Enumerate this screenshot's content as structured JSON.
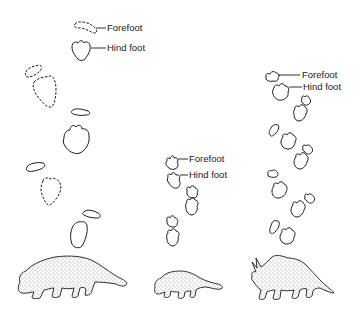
{
  "figure": {
    "ink_color": "#1a1a1a",
    "background": "#ffffff"
  },
  "trackways": [
    {
      "name": "large-ankylosaur-trackway",
      "labels": {
        "forefoot": "Forefoot",
        "hind_foot": "Hind foot"
      },
      "animal": "ankylosaur-large"
    },
    {
      "name": "small-ankylosaur-trackway",
      "labels": {
        "forefoot": "Forefoot",
        "hind_foot": "Hind foot"
      },
      "animal": "ankylosaur-small"
    },
    {
      "name": "ceratopsian-trackway",
      "labels": {
        "forefoot": "Forefoot",
        "hind_foot": "Hind foot"
      },
      "animal": "ceratopsian"
    }
  ]
}
